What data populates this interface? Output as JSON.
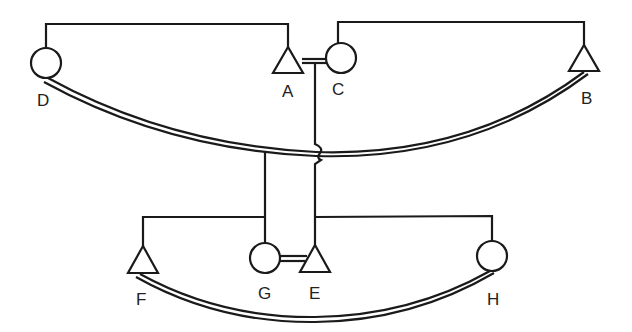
{
  "diagram": {
    "type": "pedigree-style network",
    "colors": {
      "line": "#1a1a1a",
      "background": "#ffffff"
    },
    "nodes": [
      {
        "id": "D",
        "label": "D",
        "shape": "circle"
      },
      {
        "id": "A",
        "label": "A",
        "shape": "triangle"
      },
      {
        "id": "C",
        "label": "C",
        "shape": "circle"
      },
      {
        "id": "B",
        "label": "B",
        "shape": "triangle"
      },
      {
        "id": "F",
        "label": "F",
        "shape": "triangle"
      },
      {
        "id": "G",
        "label": "G",
        "shape": "circle"
      },
      {
        "id": "E",
        "label": "E",
        "shape": "triangle"
      },
      {
        "id": "H",
        "label": "H",
        "shape": "circle"
      }
    ],
    "edges": [
      {
        "from": "D",
        "to": "A",
        "style": "single-bracket"
      },
      {
        "from": "C",
        "to": "B",
        "style": "single-bracket"
      },
      {
        "from": "A",
        "to": "C",
        "style": "double"
      },
      {
        "from": "D",
        "to": "B",
        "style": "double-curve"
      },
      {
        "from": "F",
        "to": "G",
        "style": "single-bracket"
      },
      {
        "from": "E",
        "to": "H",
        "style": "single-bracket"
      },
      {
        "from": "G",
        "to": "E",
        "style": "double"
      },
      {
        "from": "F",
        "to": "H",
        "style": "double-curve"
      },
      {
        "from": "D-A",
        "to": "F-G",
        "style": "vertical-link"
      },
      {
        "from": "A-C",
        "to": "E-H",
        "style": "vertical-link-with-hop"
      }
    ]
  }
}
